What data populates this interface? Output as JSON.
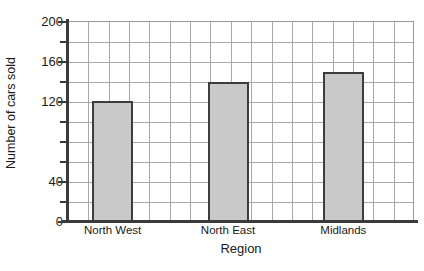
{
  "chart_data": {
    "type": "bar",
    "title": "",
    "xlabel": "Region",
    "ylabel": "Number of cars sold",
    "categories": [
      "North West",
      "North East",
      "Midlands"
    ],
    "values": [
      121,
      140,
      150
    ],
    "ylim": [
      0,
      200
    ],
    "y_major_ticks": [
      0,
      40,
      120,
      160,
      200
    ],
    "y_major_tick_labels": [
      "0",
      "40",
      "120",
      "160",
      "200"
    ],
    "y_minor_ticks": [
      20,
      60,
      80,
      100,
      140,
      180
    ],
    "y_gridline_step": 20,
    "x_gridline_count": 17,
    "grid": "on",
    "legend": "none",
    "bar_fill_color": "#c9c9c9",
    "bar_edge_color": "#3d3d3d",
    "gridline_color": "#a8a8a8",
    "axis_color": "#3a3a3a",
    "background_color": "#ffffff"
  }
}
